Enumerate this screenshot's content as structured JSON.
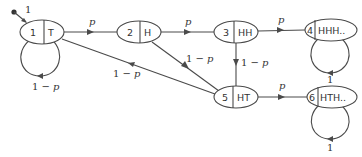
{
  "diagram": {
    "type": "state-transition",
    "start": {
      "label": "1"
    },
    "nodes": [
      {
        "id": "1",
        "state": "T"
      },
      {
        "id": "2",
        "state": "H"
      },
      {
        "id": "3",
        "state": "HH"
      },
      {
        "id": "4",
        "state": "HHH.."
      },
      {
        "id": "5",
        "state": "HT"
      },
      {
        "id": "6",
        "state": "HTH.."
      }
    ],
    "edges": [
      {
        "from": "start",
        "to": "1",
        "label": "1"
      },
      {
        "from": "1",
        "to": "1",
        "label": "1 − p"
      },
      {
        "from": "1",
        "to": "2",
        "label": "p"
      },
      {
        "from": "2",
        "to": "3",
        "label": "p"
      },
      {
        "from": "3",
        "to": "4",
        "label": "p"
      },
      {
        "from": "4",
        "to": "4",
        "label": "1"
      },
      {
        "from": "3",
        "to": "5",
        "label": "1 − p"
      },
      {
        "from": "2",
        "to": "5",
        "label": "1 − p"
      },
      {
        "from": "5",
        "to": "1",
        "label": "1 − p"
      },
      {
        "from": "5",
        "to": "6",
        "label": "p"
      },
      {
        "from": "6",
        "to": "6",
        "label": "1"
      }
    ]
  }
}
